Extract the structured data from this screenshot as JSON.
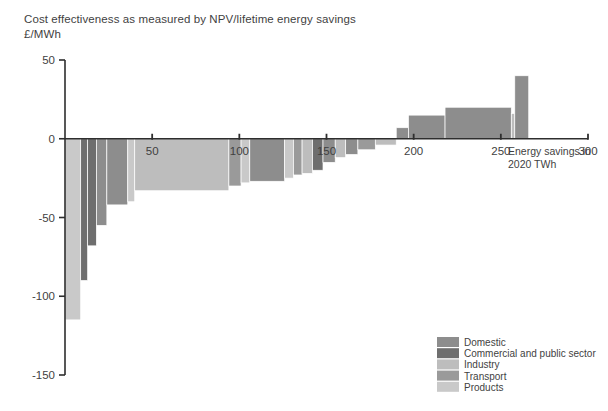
{
  "title": {
    "line1": "Cost effectiveness as measured by NPV/lifetime energy savings",
    "line2": "£/MWh"
  },
  "annotation": {
    "line1": "Energy savings in",
    "line2": "2020 TWh"
  },
  "legend": {
    "position": "bottom-right",
    "items": [
      {
        "label": "Domestic",
        "color": "#8d8d8d"
      },
      {
        "label": "Commercial and public sector",
        "color": "#6e6e6e"
      },
      {
        "label": "Industry",
        "color": "#bdbdbd"
      },
      {
        "label": "Transport",
        "color": "#9a9a9a"
      },
      {
        "label": "Products",
        "color": "#c9c9c9"
      }
    ]
  },
  "chart_data": {
    "type": "bar",
    "subtype": "waterfall-macc",
    "title": "Cost effectiveness as measured by NPV/lifetime energy savings",
    "xlabel": "Energy savings in 2020 TWh",
    "ylabel": "£/MWh",
    "xlim": [
      0,
      300
    ],
    "ylim": [
      -150,
      50
    ],
    "xticks": [
      50,
      100,
      150,
      200,
      250,
      300
    ],
    "yticks": [
      50,
      0,
      -50,
      -100,
      -150
    ],
    "grid": false,
    "note": "Width of each bar is the energy saving (TWh); height is cost effectiveness (£/MWh).",
    "bars": [
      {
        "x_start": 0,
        "x_end": 9,
        "width": 9,
        "value": -115,
        "category": "Products"
      },
      {
        "x_start": 9,
        "x_end": 13,
        "width": 4,
        "value": -90,
        "category": "Commercial and public sector"
      },
      {
        "x_start": 13,
        "x_end": 18,
        "width": 5,
        "value": -68,
        "category": "Commercial and public sector"
      },
      {
        "x_start": 18,
        "x_end": 24,
        "width": 6,
        "value": -55,
        "category": "Domestic"
      },
      {
        "x_start": 24,
        "x_end": 36,
        "width": 12,
        "value": -42,
        "category": "Domestic"
      },
      {
        "x_start": 36,
        "x_end": 40,
        "width": 4,
        "value": -40,
        "category": "Products"
      },
      {
        "x_start": 40,
        "x_end": 94,
        "width": 54,
        "value": -33,
        "category": "Industry"
      },
      {
        "x_start": 94,
        "x_end": 101,
        "width": 7,
        "value": -30,
        "category": "Transport"
      },
      {
        "x_start": 101,
        "x_end": 106,
        "width": 5,
        "value": -28,
        "category": "Products"
      },
      {
        "x_start": 106,
        "x_end": 126,
        "width": 20,
        "value": -27,
        "category": "Domestic"
      },
      {
        "x_start": 126,
        "x_end": 131,
        "width": 5,
        "value": -25,
        "category": "Products"
      },
      {
        "x_start": 131,
        "x_end": 136,
        "width": 5,
        "value": -23,
        "category": "Transport"
      },
      {
        "x_start": 136,
        "x_end": 142,
        "width": 6,
        "value": -22,
        "category": "Industry"
      },
      {
        "x_start": 142,
        "x_end": 148,
        "width": 6,
        "value": -20,
        "category": "Commercial and public sector"
      },
      {
        "x_start": 148,
        "x_end": 155,
        "width": 7,
        "value": -15,
        "category": "Domestic"
      },
      {
        "x_start": 155,
        "x_end": 161,
        "width": 6,
        "value": -12,
        "category": "Industry"
      },
      {
        "x_start": 161,
        "x_end": 168,
        "width": 7,
        "value": -10,
        "category": "Domestic"
      },
      {
        "x_start": 168,
        "x_end": 178,
        "width": 10,
        "value": -7,
        "category": "Transport"
      },
      {
        "x_start": 178,
        "x_end": 190,
        "width": 12,
        "value": -4,
        "category": "Industry"
      },
      {
        "x_start": 190,
        "x_end": 197,
        "width": 7,
        "value": 7,
        "category": "Domestic"
      },
      {
        "x_start": 197,
        "x_end": 218,
        "width": 21,
        "value": 15,
        "category": "Domestic"
      },
      {
        "x_start": 218,
        "x_end": 256,
        "width": 38,
        "value": 20,
        "category": "Domestic"
      },
      {
        "x_start": 256,
        "x_end": 258,
        "width": 2,
        "value": 16,
        "category": "Industry"
      },
      {
        "x_start": 258,
        "x_end": 266,
        "width": 8,
        "value": 40,
        "category": "Domestic"
      }
    ]
  }
}
